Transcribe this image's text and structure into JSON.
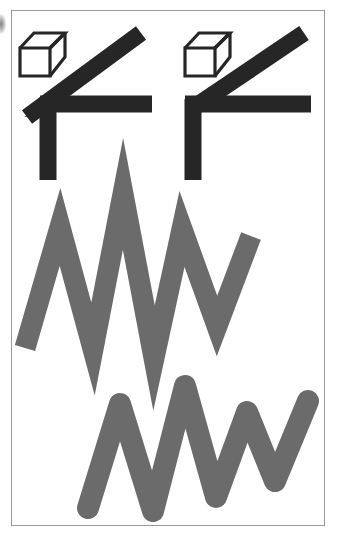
{
  "page": {
    "width": 337,
    "height": 537,
    "background_color": "#ffffff"
  },
  "frame": {
    "border_color": "#9a9a9a",
    "border_width": 1,
    "x": 11,
    "y": 10,
    "width": 314,
    "height": 516
  },
  "colors": {
    "ink_black": "#262626",
    "zigzag_gray": "#6b6b6b",
    "frame_gray": "#9a9a9a",
    "paper_white": "#ffffff"
  },
  "figures": [
    {
      "id": "top-left-angle-figure",
      "name": "angle-figure-acute",
      "kind": "black-angle-with-cube",
      "color": "#262626",
      "stroke_width": 17,
      "cube": {
        "name": "wireframe-cube-left",
        "x": 20,
        "y": 28,
        "width": 45,
        "height": 48,
        "stroke_color": "#262626",
        "stroke_width": 3.2
      },
      "vertex": {
        "x": 48,
        "y": 104
      },
      "arms": [
        {
          "name": "vertical-arm",
          "to": {
            "x": 48,
            "y": 180
          }
        },
        {
          "name": "horizontal-arm",
          "to": {
            "x": 152,
            "y": 104
          }
        },
        {
          "name": "diagonal-arm",
          "to": {
            "x": 140,
            "y": 40
          },
          "overshoot": true
        }
      ]
    },
    {
      "id": "top-right-angle-figure",
      "name": "angle-figure-right",
      "kind": "black-angle-with-cube",
      "color": "#262626",
      "stroke_width": 17,
      "cube": {
        "name": "wireframe-cube-right",
        "x": 185,
        "y": 28,
        "width": 45,
        "height": 48,
        "stroke_color": "#262626",
        "stroke_width": 3.2
      },
      "vertex": {
        "x": 193,
        "y": 104
      },
      "arms": [
        {
          "name": "vertical-arm",
          "to": {
            "x": 193,
            "y": 180
          }
        },
        {
          "name": "horizontal-arm",
          "to": {
            "x": 311,
            "y": 104
          }
        },
        {
          "name": "diagonal-arm",
          "to": {
            "x": 303,
            "y": 40
          },
          "overshoot": false
        }
      ]
    },
    {
      "id": "middle-zigzag",
      "name": "zigzag-sharp",
      "kind": "polyline-zigzag",
      "color": "#6b6b6b",
      "stroke_width": 21,
      "line_join": "miter",
      "line_cap": "butt",
      "miter_limit": 20,
      "points": [
        {
          "x": 25,
          "y": 348
        },
        {
          "x": 60,
          "y": 227
        },
        {
          "x": 93,
          "y": 349
        },
        {
          "x": 123,
          "y": 194
        },
        {
          "x": 154,
          "y": 358
        },
        {
          "x": 182,
          "y": 229
        },
        {
          "x": 217,
          "y": 326
        },
        {
          "x": 251,
          "y": 236
        }
      ]
    },
    {
      "id": "bottom-zigzag",
      "name": "zigzag-rounded",
      "kind": "polyline-zigzag",
      "color": "#6b6b6b",
      "stroke_width": 22,
      "line_join": "round",
      "line_cap": "round",
      "points": [
        {
          "x": 88,
          "y": 508
        },
        {
          "x": 120,
          "y": 404
        },
        {
          "x": 153,
          "y": 511
        },
        {
          "x": 185,
          "y": 386
        },
        {
          "x": 216,
          "y": 497
        },
        {
          "x": 247,
          "y": 412
        },
        {
          "x": 275,
          "y": 481
        },
        {
          "x": 308,
          "y": 401
        }
      ]
    }
  ],
  "artifacts": [
    {
      "name": "scan-edge-smudge",
      "description": "dark scanning artifact at the far left margin",
      "x": 0,
      "y": 14,
      "width": 6,
      "height": 20
    }
  ]
}
